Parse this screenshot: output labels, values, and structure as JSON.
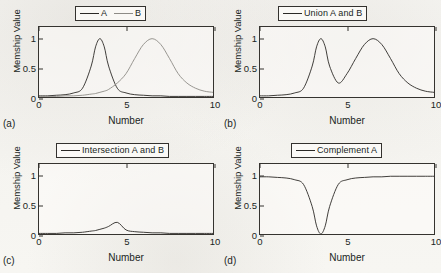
{
  "figure": {
    "background_color": "#f7f6f3",
    "line_color": "#2b2926",
    "line_color_b": "#8d8b86",
    "axis_color": "#35332f"
  },
  "panels": [
    {
      "letter": "(a)",
      "legend": [
        {
          "label": "A",
          "color": "#2b2926"
        },
        {
          "label": "B",
          "color": "#8d8b86"
        }
      ],
      "chart_data": {
        "type": "line",
        "title": "",
        "xlabel": "Number",
        "ylabel": "Memship Value",
        "xlim": [
          0,
          10
        ],
        "ylim": [
          0,
          1.2
        ],
        "xticks": [
          0,
          5,
          10
        ],
        "yticks": [
          0,
          0.5,
          1
        ],
        "ytick_labels": [
          "0",
          "0.5",
          "1"
        ],
        "xtick_labels": [
          "0",
          "5",
          "10"
        ],
        "grid": false,
        "legend_position": "above-center",
        "x": [
          0,
          0.5,
          1,
          1.5,
          2,
          2.5,
          3,
          3.25,
          3.5,
          3.75,
          4,
          4.5,
          5,
          5.5,
          6,
          6.5,
          7,
          7.5,
          8,
          8.5,
          9,
          9.5,
          10
        ],
        "series": [
          {
            "name": "A",
            "color": "#2b2926",
            "values": [
              0.02,
              0.02,
              0.03,
              0.04,
              0.07,
              0.15,
              0.53,
              0.86,
              1.0,
              0.86,
              0.53,
              0.15,
              0.07,
              0.04,
              0.03,
              0.02,
              0.02,
              0.01,
              0.01,
              0.01,
              0.01,
              0.01,
              0.01
            ]
          },
          {
            "name": "B",
            "color": "#8d8b86",
            "values": [
              0.01,
              0.01,
              0.01,
              0.02,
              0.02,
              0.03,
              0.05,
              0.06,
              0.08,
              0.1,
              0.13,
              0.24,
              0.4,
              0.66,
              0.9,
              1.0,
              0.9,
              0.66,
              0.4,
              0.24,
              0.15,
              0.1,
              0.08
            ]
          }
        ]
      }
    },
    {
      "letter": "(b)",
      "legend": [
        {
          "label": "Union  A and B",
          "color": "#2b2926"
        }
      ],
      "chart_data": {
        "type": "line",
        "title": "",
        "xlabel": "Number",
        "ylabel": "Memship Value",
        "xlim": [
          0,
          10
        ],
        "ylim": [
          0,
          1.2
        ],
        "xticks": [
          0,
          5,
          10
        ],
        "yticks": [
          0,
          0.5,
          1
        ],
        "ytick_labels": [
          "0",
          "0.5",
          "1"
        ],
        "xtick_labels": [
          "0",
          "5",
          "10"
        ],
        "grid": false,
        "legend_position": "above-center",
        "x": [
          0,
          0.5,
          1,
          1.5,
          2,
          2.5,
          3,
          3.25,
          3.5,
          3.75,
          4,
          4.5,
          5,
          5.5,
          6,
          6.5,
          7,
          7.5,
          8,
          8.5,
          9,
          9.5,
          10
        ],
        "series": [
          {
            "name": "Union A and B",
            "color": "#2b2926",
            "values": [
              0.02,
              0.02,
              0.03,
              0.04,
              0.07,
              0.15,
              0.53,
              0.86,
              1.0,
              0.86,
              0.53,
              0.24,
              0.4,
              0.66,
              0.9,
              1.0,
              0.9,
              0.66,
              0.4,
              0.24,
              0.15,
              0.1,
              0.08
            ]
          }
        ]
      }
    },
    {
      "letter": "(c)",
      "legend": [
        {
          "label": "Intersection A and B",
          "color": "#2b2926"
        }
      ],
      "chart_data": {
        "type": "line",
        "title": "",
        "xlabel": "Number",
        "ylabel": "Memship Value",
        "xlim": [
          0,
          10
        ],
        "ylim": [
          0,
          1.2
        ],
        "xticks": [
          0,
          5,
          10
        ],
        "yticks": [
          0,
          0.5,
          1
        ],
        "ytick_labels": [
          "0",
          "0.5",
          "1"
        ],
        "xtick_labels": [
          "0",
          "5",
          "10"
        ],
        "grid": false,
        "legend_position": "above-center",
        "x": [
          0,
          0.5,
          1,
          1.5,
          2,
          2.5,
          3,
          3.25,
          3.5,
          3.75,
          4,
          4.5,
          5,
          5.5,
          6,
          6.5,
          7,
          7.5,
          8,
          8.5,
          9,
          9.5,
          10
        ],
        "series": [
          {
            "name": "Intersection A and B",
            "color": "#2b2926",
            "values": [
              0.01,
              0.01,
              0.01,
              0.02,
              0.02,
              0.03,
              0.05,
              0.06,
              0.08,
              0.1,
              0.13,
              0.2,
              0.07,
              0.04,
              0.03,
              0.02,
              0.02,
              0.01,
              0.01,
              0.01,
              0.01,
              0.01,
              0.01
            ]
          }
        ]
      }
    },
    {
      "letter": "(d)",
      "legend": [
        {
          "label": "Complement A",
          "color": "#2b2926"
        }
      ],
      "chart_data": {
        "type": "line",
        "title": "",
        "xlabel": "Number",
        "ylabel": "Memship Value",
        "xlim": [
          0,
          10
        ],
        "ylim": [
          0,
          1.2
        ],
        "xticks": [
          0,
          5,
          10
        ],
        "yticks": [
          0,
          0.5,
          1
        ],
        "ytick_labels": [
          "0",
          "0.5",
          "1"
        ],
        "xtick_labels": [
          "0",
          "5",
          "10"
        ],
        "grid": false,
        "legend_position": "above-center",
        "x": [
          0,
          0.5,
          1,
          1.5,
          2,
          2.5,
          3,
          3.25,
          3.5,
          3.75,
          4,
          4.5,
          5,
          5.5,
          6,
          6.5,
          7,
          7.5,
          8,
          8.5,
          9,
          9.5,
          10
        ],
        "series": [
          {
            "name": "Complement A",
            "color": "#2b2926",
            "values": [
              0.98,
              0.98,
              0.97,
              0.96,
              0.93,
              0.85,
              0.47,
              0.14,
              0.0,
              0.14,
              0.47,
              0.85,
              0.93,
              0.96,
              0.97,
              0.98,
              0.98,
              0.99,
              0.99,
              0.99,
              0.99,
              0.99,
              0.99
            ]
          }
        ]
      }
    }
  ]
}
